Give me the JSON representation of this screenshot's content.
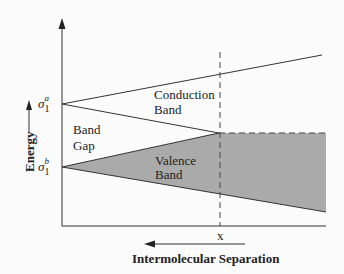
{
  "diagram": {
    "type": "energy-band-diagram",
    "axes": {
      "y_label": "Energy",
      "x_label": "Intermolecular Separation",
      "x_marker": "x"
    },
    "levels": {
      "upper": {
        "symbol": "σ",
        "subscript": "1",
        "superscript": "a"
      },
      "lower": {
        "symbol": "σ",
        "subscript": "1",
        "superscript": "b"
      }
    },
    "regions": {
      "conduction": {
        "line1": "Conduction",
        "line2": "Band"
      },
      "gap": {
        "line1": "Band",
        "line2": "Gap"
      },
      "valence": {
        "line1": "Valence",
        "line2": "Band"
      }
    },
    "colors": {
      "line": "#333333",
      "valence_fill": "#aaaaaa",
      "background": "#fbfbfb"
    }
  }
}
